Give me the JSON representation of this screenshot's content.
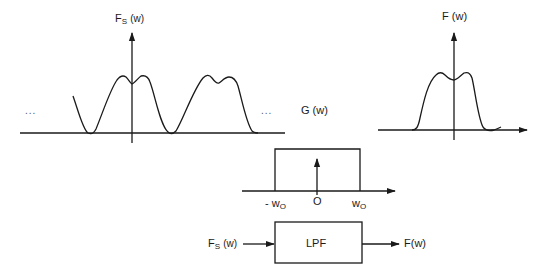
{
  "figure": {
    "sampled_spectrum": {
      "label_main": "F",
      "label_sub": "S",
      "label_arg": "(w)",
      "ellipsis_left": "...",
      "ellipsis_right": "..."
    },
    "original_spectrum": {
      "label": "F (w)"
    },
    "filter_response": {
      "label": "G (w)",
      "tick_neg": "- w",
      "tick_neg_sub": "O",
      "tick_zero": "O",
      "tick_pos": "w",
      "tick_pos_sub": "O"
    },
    "block_diagram": {
      "input_main": "F",
      "input_sub": "S",
      "input_arg": "(w)",
      "block_label": "LPF",
      "output_label": "F(w)"
    }
  },
  "colors": {
    "line": "#1a1a1a",
    "background": "#ffffff"
  }
}
